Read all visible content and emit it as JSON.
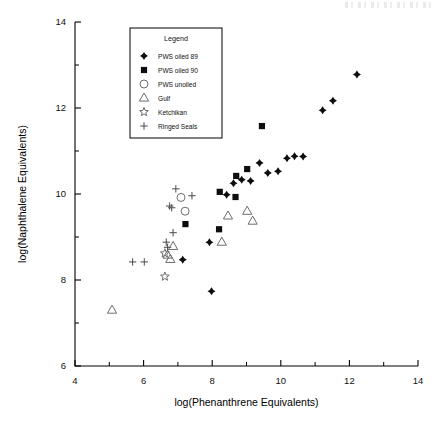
{
  "figure": {
    "background_color": "#ffffff",
    "ink_color": "#000000",
    "open_marker_color": "#6d6d6d"
  },
  "chart_data": {
    "type": "scatter",
    "title": "",
    "xlabel": "log(Phenanthrene Equivalents)",
    "ylabel": "log(Naphthalene Equivalents)",
    "xlim": [
      4,
      14
    ],
    "ylim": [
      6,
      14
    ],
    "xticks": [
      4,
      6,
      8,
      10,
      12,
      14
    ],
    "yticks": [
      6,
      8,
      10,
      12,
      14
    ],
    "xtick_labels": [
      "4",
      "6",
      "8",
      "10",
      "12",
      "14"
    ],
    "ytick_labels": [
      "6",
      "8",
      "10",
      "12",
      "14"
    ],
    "minor_ticks": true,
    "grid": false,
    "legend": {
      "title": "Legend",
      "position": "upper-left-inset",
      "entries": [
        {
          "label": "PWS oiled 89",
          "marker": "filled-diamond"
        },
        {
          "label": "PWS oiled 90",
          "marker": "filled-square"
        },
        {
          "label": "PWS unoiled",
          "marker": "open-circle"
        },
        {
          "label": "Gulf",
          "marker": "open-triangle"
        },
        {
          "label": "Ketchikan",
          "marker": "open-star"
        },
        {
          "label": "Ringed Seals",
          "marker": "plus"
        }
      ]
    },
    "series": [
      {
        "name": "PWS oiled 89",
        "marker": "filled-diamond",
        "color": "#0d0d0d",
        "points": [
          [
            12.22,
            12.78
          ],
          [
            11.52,
            12.17
          ],
          [
            11.22,
            11.95
          ],
          [
            10.65,
            10.87
          ],
          [
            10.4,
            10.88
          ],
          [
            10.18,
            10.83
          ],
          [
            9.92,
            10.53
          ],
          [
            9.62,
            10.49
          ],
          [
            9.38,
            10.72
          ],
          [
            9.12,
            10.3
          ],
          [
            8.86,
            10.33
          ],
          [
            8.62,
            10.25
          ],
          [
            8.42,
            9.98
          ],
          [
            7.92,
            8.88
          ],
          [
            7.14,
            8.47
          ],
          [
            7.98,
            7.74
          ]
        ]
      },
      {
        "name": "PWS oiled 90",
        "marker": "filled-square",
        "color": "#0d0d0d",
        "points": [
          [
            9.45,
            11.58
          ],
          [
            9.02,
            10.58
          ],
          [
            8.7,
            10.42
          ],
          [
            8.22,
            10.05
          ],
          [
            8.68,
            9.93
          ],
          [
            8.2,
            9.18
          ],
          [
            7.22,
            9.3
          ]
        ]
      },
      {
        "name": "PWS unoiled",
        "marker": "open-circle",
        "color": "#6d6d6d",
        "points": [
          [
            7.09,
            9.92
          ],
          [
            7.21,
            9.6
          ]
        ]
      },
      {
        "name": "Gulf",
        "marker": "open-triangle",
        "color": "#6d6d6d",
        "points": [
          [
            9.02,
            9.6
          ],
          [
            9.18,
            9.37
          ],
          [
            8.46,
            9.49
          ],
          [
            8.28,
            8.88
          ],
          [
            6.86,
            8.78
          ],
          [
            6.7,
            8.58
          ],
          [
            6.78,
            8.48
          ],
          [
            5.08,
            7.3
          ]
        ]
      },
      {
        "name": "Ketchikan",
        "marker": "open-star",
        "color": "#6d6d6d",
        "points": [
          [
            6.62,
            8.62
          ],
          [
            6.62,
            8.08
          ]
        ]
      },
      {
        "name": "Ringed Seals",
        "marker": "plus",
        "color": "#4a4a4a",
        "points": [
          [
            6.94,
            10.12
          ],
          [
            7.41,
            9.96
          ],
          [
            6.76,
            9.72
          ],
          [
            6.82,
            9.68
          ],
          [
            6.86,
            9.1
          ],
          [
            6.66,
            8.88
          ],
          [
            6.7,
            8.76
          ],
          [
            5.68,
            8.42
          ],
          [
            6.02,
            8.42
          ]
        ]
      }
    ]
  }
}
